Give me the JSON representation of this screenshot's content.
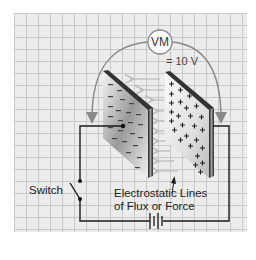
{
  "diagram": {
    "meter": {
      "label": "VM",
      "reading": "= 10 V"
    },
    "labels": {
      "switch": "Switch",
      "flux_line1": "Electrostatic Lines",
      "flux_line2": "of Flux or Force"
    },
    "plates": {
      "left": {
        "charge": "negative",
        "symbol": "−"
      },
      "right": {
        "charge": "positive",
        "symbol": "+"
      }
    },
    "components": [
      "voltmeter",
      "negative plate",
      "positive plate",
      "switch",
      "battery",
      "flux lines"
    ],
    "colors": {
      "background": "#ececec",
      "grid": "#c9c9c9",
      "wire": "#1a1a1a",
      "meter_lead": "#8a8a8a",
      "flux_arrow": "#bdbdbd",
      "plate_edge": "#2b2b2b"
    }
  }
}
